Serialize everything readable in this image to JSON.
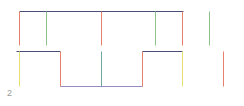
{
  "diagram": {
    "label": "2",
    "colors": {
      "navy": "#4a4f7a",
      "purple": "#9a88c0",
      "red": "#e8806e",
      "green": "#8fc28a",
      "yellow": "#e8e070",
      "teal": "#6fa8a0"
    },
    "segments": [
      {
        "id": "top-bar",
        "x1": 19,
        "y1": 11,
        "x2": 183,
        "y2": 11,
        "color": "#4a4f7a"
      },
      {
        "id": "v-top-1",
        "x1": 19,
        "y1": 11,
        "x2": 19,
        "y2": 45,
        "color": "#e8806e"
      },
      {
        "id": "v-top-2",
        "x1": 46,
        "y1": 11,
        "x2": 46,
        "y2": 45,
        "color": "#8fc28a"
      },
      {
        "id": "v-top-3",
        "x1": 101,
        "y1": 11,
        "x2": 101,
        "y2": 45,
        "color": "#e8806e"
      },
      {
        "id": "v-top-4",
        "x1": 155,
        "y1": 11,
        "x2": 155,
        "y2": 45,
        "color": "#8fc28a"
      },
      {
        "id": "v-top-5",
        "x1": 182,
        "y1": 11,
        "x2": 182,
        "y2": 45,
        "color": "#e8806e"
      },
      {
        "id": "v-top-6",
        "x1": 209,
        "y1": 11,
        "x2": 209,
        "y2": 45,
        "color": "#8fc28a"
      },
      {
        "id": "mid-left-bar",
        "x1": 16,
        "y1": 51,
        "x2": 60,
        "y2": 51,
        "color": "#4a4f7a"
      },
      {
        "id": "step-down",
        "x1": 60,
        "y1": 51,
        "x2": 60,
        "y2": 86,
        "color": "#e8806e"
      },
      {
        "id": "bottom-bar",
        "x1": 60,
        "y1": 86,
        "x2": 142,
        "y2": 86,
        "color": "#9a88c0"
      },
      {
        "id": "step-up",
        "x1": 142,
        "y1": 51,
        "x2": 142,
        "y2": 86,
        "color": "#e8806e"
      },
      {
        "id": "mid-right-bar",
        "x1": 142,
        "y1": 51,
        "x2": 182,
        "y2": 51,
        "color": "#4a4f7a"
      },
      {
        "id": "v-bot-1",
        "x1": 19,
        "y1": 51,
        "x2": 19,
        "y2": 86,
        "color": "#e8e070"
      },
      {
        "id": "v-bot-2",
        "x1": 101,
        "y1": 51,
        "x2": 101,
        "y2": 86,
        "color": "#6fa8a0"
      },
      {
        "id": "v-bot-3",
        "x1": 182,
        "y1": 51,
        "x2": 182,
        "y2": 86,
        "color": "#e8e070"
      },
      {
        "id": "v-bot-4",
        "x1": 223,
        "y1": 51,
        "x2": 223,
        "y2": 86,
        "color": "#e8806e"
      }
    ]
  }
}
